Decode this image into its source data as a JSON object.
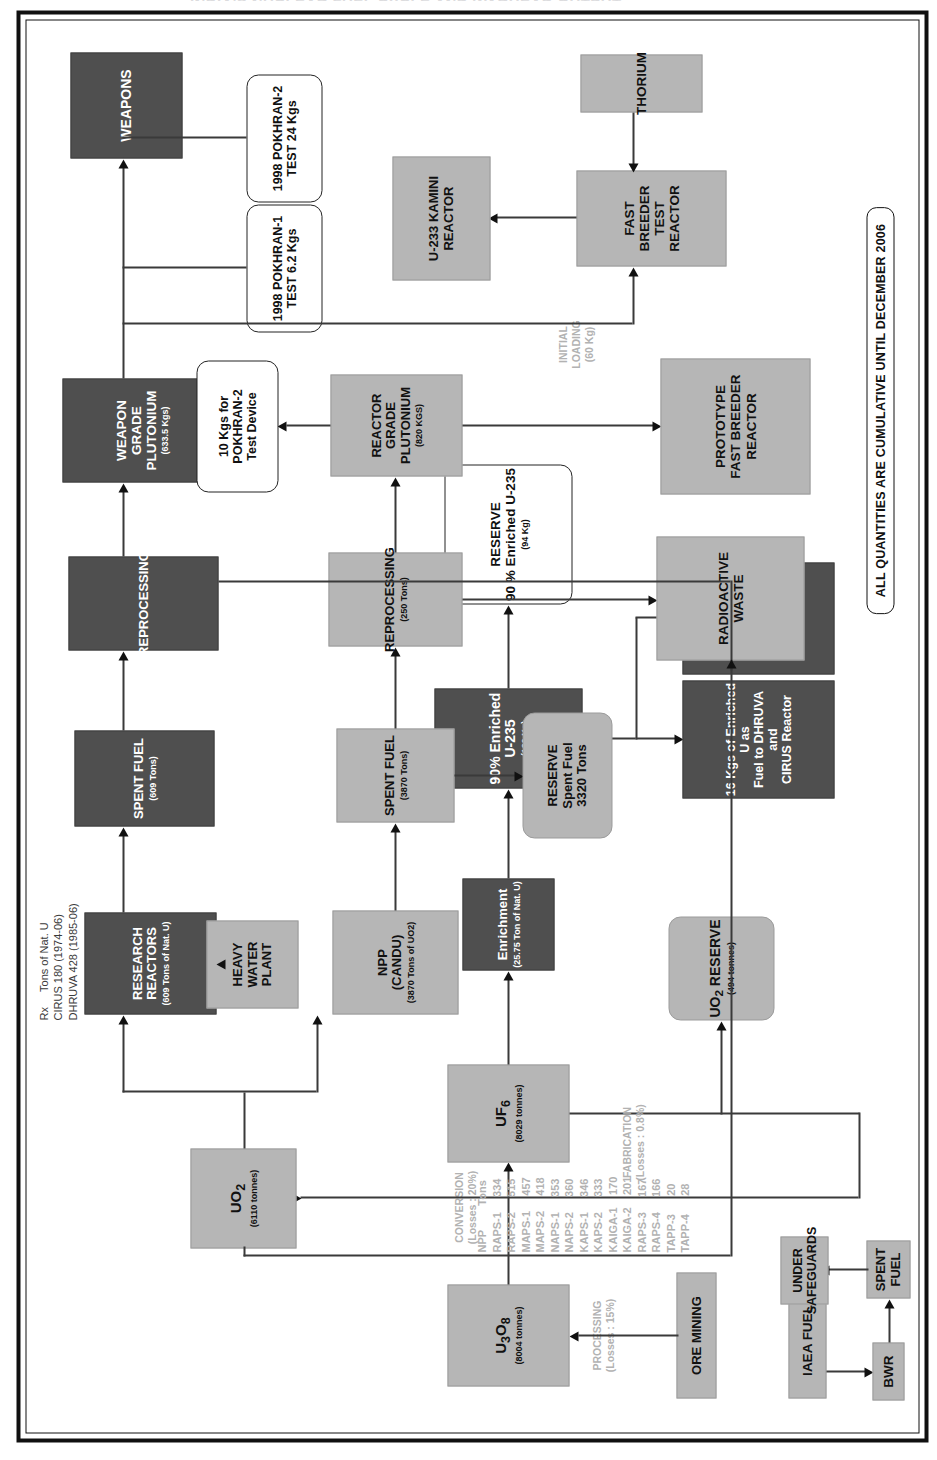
{
  "title": "INDIA'S NUCLEAR FUEL CYCLE AND WARHEAD OUTPUT",
  "footer_note": "ALL QUANTITIES ARE CUMULATIVE UNTIL DECEMBER 2006",
  "process_labels": {
    "processing": "PROCESSING\n(Losses : 15%)",
    "conversion": "CONVERSION\n(Losses : 20%)",
    "fabrication": "FABRICATION\n(Losses : 0.8%)",
    "initial_loading": "INITIAL\nLOADING\n(60 Kg)"
  },
  "nodes": {
    "ore_mining": {
      "title": "ORE MINING",
      "sub": ""
    },
    "u3o8": {
      "title": "U3O8",
      "sub": "(8004 tonnes)"
    },
    "uf6": {
      "title": "UF6",
      "sub": "(8029 tonnes)"
    },
    "enrichment": {
      "title": "Enrichment",
      "sub": "(25.75 Ton of Nat. U)"
    },
    "enriched_u235": {
      "title": "90% Enriched U-235",
      "sub": "(120 Kg)"
    },
    "reserve_u235": {
      "title": "RESERVE\n90 % Enriched U-235",
      "sub": "(94 Kg)"
    },
    "enriched_16kg": {
      "title": "16 Kgs of Enriched U as\nFuel to DHRUVA and\nCIRUS Reactor",
      "sub": ""
    },
    "enriched_10kg": {
      "title": "10 Kgs of Enriched U\nfor Pokhran-II Tests",
      "sub": ""
    },
    "uo2_reserve": {
      "title": "UO2 RESERVE",
      "sub": "(494 tonnes)"
    },
    "uo2": {
      "title": "UO2",
      "sub": "(6110 tonnes)"
    },
    "research_reactors": {
      "title": "RESEARCH\nREACTORS",
      "sub": "(609 Tons of Nat. U)"
    },
    "spent_fuel_609": {
      "title": "SPENT FUEL",
      "sub": "(609 Tons)"
    },
    "reprocessing_rr": {
      "title": "REPROCESSING",
      "sub": ""
    },
    "weapon_grade_pu": {
      "title": "WEAPON\nGRADE\nPLUTONIUM",
      "sub": "(633.5 Kgs)"
    },
    "weapons": {
      "title": "WEAPONS",
      "sub": ""
    },
    "pokhran1": {
      "title": "1998 POKHRAN-1\nTEST 6.2 Kgs",
      "sub": ""
    },
    "pokhran2": {
      "title": "1998 POKHRAN-2\nTEST 24 Kgs",
      "sub": ""
    },
    "heavy_water_plant": {
      "title": "HEAVY\nWATER\nPLANT",
      "sub": ""
    },
    "npp_candu": {
      "title": "NPP\n(CANDU)",
      "sub": "(3870 Tons of UO2)"
    },
    "spent_fuel_3870": {
      "title": "SPENT FUEL",
      "sub": "(3870 Tons)"
    },
    "reprocessing_npp": {
      "title": "REPROCESSING",
      "sub": "(250 Tons)"
    },
    "reactor_grade_pu": {
      "title": "REACTOR\nGRADE\nPLUTONIUM",
      "sub": "(820 KGS)"
    },
    "pokhran2_device": {
      "title": "10 Kgs for\nPOKHRAN-2\nTest Device",
      "sub": ""
    },
    "reserve_spent_fuel": {
      "title": "RESERVE\nSpent Fuel\n3320 Tons",
      "sub": ""
    },
    "radioactive_waste": {
      "title": "RADIOACTIVE\nWASTE",
      "sub": ""
    },
    "pfbr": {
      "title": "PROTOTYPE\nFAST BREEDER\nREACTOR",
      "sub": ""
    },
    "fbtr": {
      "title": "FAST\nBREEDER\nTEST\nREACTOR",
      "sub": ""
    },
    "kamini": {
      "title": "U-233 KAMINI\nREACTOR",
      "sub": ""
    },
    "thorium": {
      "title": "THORIUM",
      "sub": ""
    },
    "iaea_fuel": {
      "title": "IAEA FUEL",
      "sub": ""
    },
    "bwr": {
      "title": "BWR",
      "sub": ""
    },
    "spent_fuel_bwr": {
      "title": "SPENT FUEL",
      "sub": ""
    },
    "under_safeguards": {
      "title": "UNDER\nSAFEGUARDS",
      "sub": ""
    }
  },
  "research_reactor_table": {
    "header": "Rx     Tons of Nat. U",
    "rows": [
      {
        "name": "CIRUS 180 (1974-06)"
      },
      {
        "name": "DHRUVA 428 (1985-06)"
      }
    ],
    "text": "Rx     Tons of Nat. U\nCIRUS 180 (1974-06)\nDHRUVA 428 (1985-06)"
  },
  "npp_table": {
    "header": [
      "NPP",
      "Tons"
    ],
    "rows": [
      [
        "RAPS-1",
        "334"
      ],
      [
        "RAPS-2",
        "515"
      ],
      [
        "MAPS-1",
        "457"
      ],
      [
        "MAPS-2",
        "418"
      ],
      [
        "NAPS-1",
        "353"
      ],
      [
        "NAPS-2",
        "360"
      ],
      [
        "KAPS-1",
        "346"
      ],
      [
        "KAPS-2",
        "333"
      ],
      [
        "KAIGA-1",
        "170"
      ],
      [
        "KAIGA-2",
        "201"
      ],
      [
        "RAPS-3",
        "167"
      ],
      [
        "RAPS-4",
        "166"
      ],
      [
        "TAPP-3",
        "20"
      ],
      [
        "TAPP-4",
        "28"
      ]
    ],
    "text": "NPP        Tons\nRAPS-1     334\nRAPS-2     515\nMAPS-1     457\nMAPS-2     418\nNAPS-1     353\nNAPS-2     360\nKAPS-1     346\nKAPS-2     333\nKAIGA-1    170\nKAIGA-2    201\nRAPS-3     167\nRAPS-4     166\nTAPP-3      20\nTAPP-4      28"
  },
  "colors": {
    "gray_fill": "#b6b6b6",
    "dark_fill": "#4f4f4f",
    "white_fill": "#ffffff",
    "line": "#111111",
    "faint_label": "#b2b2b2"
  }
}
